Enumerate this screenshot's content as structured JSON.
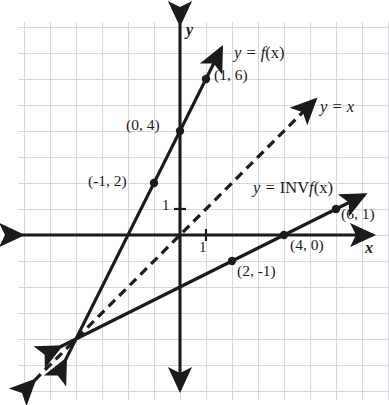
{
  "figure": {
    "kind": "coordinate-plane-graph",
    "background_color": "#ffffff",
    "grid_color": "#d8d8dc",
    "ink_color": "#1b1b1b"
  },
  "axes": {
    "x_axis_label": "x",
    "y_axis_label": "y",
    "x_tick_label": "1",
    "y_tick_label": "1",
    "origin_px": [
      180,
      235
    ],
    "unit_px": 26,
    "xlim": [
      -6.2,
      8.0
    ],
    "ylim": [
      -6.1,
      8.2
    ],
    "grid": true
  },
  "curve_labels": {
    "f": {
      "prefix": "y = ",
      "body": "f",
      "suffix": "(x)"
    },
    "identity": {
      "prefix": "y = ",
      "body": "x",
      "suffix": ""
    },
    "f_inverse": {
      "prefix": "y = ",
      "upright": "INV",
      "body": "f",
      "suffix": "(x)"
    }
  },
  "points": [
    {
      "label": "(1, 6)",
      "x": 1,
      "y": 6,
      "series": "f"
    },
    {
      "label": "(0, 4)",
      "x": 0,
      "y": 4,
      "series": "f"
    },
    {
      "label": "(-1, 2)",
      "x": -1,
      "y": 2,
      "series": "f"
    },
    {
      "label": "(6, 1)",
      "x": 6,
      "y": 1,
      "series": "f_inverse"
    },
    {
      "label": "(4, 0)",
      "x": 4,
      "y": 0,
      "series": "f_inverse"
    },
    {
      "label": "(2, -1)",
      "x": 2,
      "y": -1,
      "series": "f_inverse"
    }
  ],
  "chart_data": {
    "type": "line",
    "title": "",
    "xlabel": "x",
    "ylabel": "y",
    "xlim": [
      -6.2,
      8.0
    ],
    "ylim": [
      -6.1,
      8.2
    ],
    "grid": true,
    "legend": "inline-annotations",
    "series": [
      {
        "name": "y = f(x)",
        "style": "solid",
        "color": "#1b1b1b",
        "equation": "y = 2x + 4",
        "slope": 2,
        "intercept": 4,
        "arrows": [
          "start",
          "end"
        ],
        "x": [
          -4.4,
          1.6
        ],
        "values": [
          -4.8,
          7.2
        ],
        "marked_points": [
          [
            -1,
            2
          ],
          [
            0,
            4
          ],
          [
            1,
            6
          ]
        ]
      },
      {
        "name": "y = x",
        "style": "dashed",
        "color": "#1b1b1b",
        "equation": "y = x",
        "slope": 1,
        "intercept": 0,
        "arrows": [
          "start",
          "end"
        ],
        "x": [
          -5.6,
          5.2
        ],
        "values": [
          -5.6,
          5.2
        ],
        "marked_points": []
      },
      {
        "name": "y = INVf(x)",
        "style": "solid",
        "color": "#1b1b1b",
        "equation": "y = 0.5x - 2",
        "slope": 0.5,
        "intercept": -2,
        "arrows": [
          "start",
          "end"
        ],
        "x": [
          -4.6,
          7.1
        ],
        "values": [
          -4.3,
          1.55
        ],
        "marked_points": [
          [
            2,
            -1
          ],
          [
            4,
            0
          ],
          [
            6,
            1
          ]
        ]
      }
    ]
  },
  "label_positions": {
    "f_label": {
      "left": 234,
      "top": 45
    },
    "identity_label": {
      "left": 320,
      "top": 99
    },
    "inv_label": {
      "left": 253,
      "top": 180
    },
    "p_1_6": {
      "left": 214,
      "top": 67
    },
    "p_0_4": {
      "left": 126,
      "top": 117
    },
    "p_m1_2": {
      "left": 88,
      "top": 173
    },
    "p_6_1": {
      "left": 341,
      "top": 206
    },
    "p_4_0": {
      "left": 290,
      "top": 237
    },
    "p_2_m1": {
      "left": 237,
      "top": 263
    },
    "x_axis_label": {
      "left": 365,
      "top": 240
    },
    "y_axis_label": {
      "left": 186,
      "top": 22
    },
    "x_tick_label": {
      "left": 199,
      "top": 240
    },
    "y_tick_label": {
      "left": 162,
      "top": 198
    }
  }
}
